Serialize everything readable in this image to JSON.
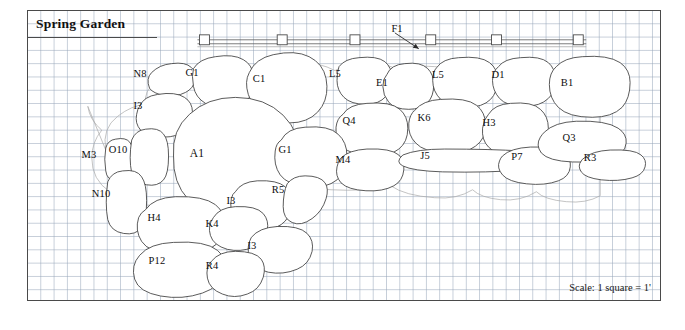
{
  "plan": {
    "title": "Spring Garden",
    "scale_note": "Scale: 1 square = 1'",
    "grid_square_px": 13.3,
    "colors": {
      "grid": "#96a5b9",
      "outline": "#3d3d3d",
      "frame": "#4a4a4a",
      "text": "#0d0d0d",
      "paper": "#ffffff"
    }
  },
  "fence": {
    "label": "F1",
    "label_x": 396,
    "label_y": 27,
    "leader_from_x": 396,
    "leader_from_y": 33,
    "leader_to_x": 422,
    "leader_to_y": 48,
    "rail_y": 42,
    "rail_x1": 196,
    "rail_x2": 585,
    "post_positions": [
      203,
      281,
      354,
      430,
      496,
      578
    ]
  },
  "beds": [
    {
      "id": "N8",
      "label": "N8",
      "x": 139,
      "y": 72,
      "size": "normal"
    },
    {
      "id": "G1a",
      "label": "G1",
      "x": 191,
      "y": 71,
      "size": "normal"
    },
    {
      "id": "C1",
      "label": "C1",
      "x": 258,
      "y": 77,
      "size": "normal"
    },
    {
      "id": "L5a",
      "label": "L5",
      "x": 334,
      "y": 72,
      "size": "normal"
    },
    {
      "id": "E1",
      "label": "E1",
      "x": 381,
      "y": 81,
      "size": "normal"
    },
    {
      "id": "L5b",
      "label": "L5",
      "x": 437,
      "y": 73,
      "size": "normal"
    },
    {
      "id": "D1",
      "label": "D1",
      "x": 497,
      "y": 73,
      "size": "normal"
    },
    {
      "id": "B1",
      "label": "B1",
      "x": 566,
      "y": 81,
      "size": "normal"
    },
    {
      "id": "I3a",
      "label": "I3",
      "x": 137,
      "y": 104,
      "size": "normal"
    },
    {
      "id": "Q4",
      "label": "Q4",
      "x": 348,
      "y": 119,
      "size": "normal"
    },
    {
      "id": "K6",
      "label": "K6",
      "x": 423,
      "y": 116,
      "size": "normal"
    },
    {
      "id": "H3",
      "label": "H3",
      "x": 488,
      "y": 121,
      "size": "normal"
    },
    {
      "id": "M3",
      "label": "M3",
      "x": 88,
      "y": 153,
      "size": "normal"
    },
    {
      "id": "O10",
      "label": "O10",
      "x": 117,
      "y": 148,
      "size": "normal"
    },
    {
      "id": "A1",
      "label": "A1",
      "x": 196,
      "y": 152,
      "size": "big"
    },
    {
      "id": "G1b",
      "label": "G1",
      "x": 284,
      "y": 148,
      "size": "normal"
    },
    {
      "id": "M4",
      "label": "M4",
      "x": 342,
      "y": 158,
      "size": "normal"
    },
    {
      "id": "J5",
      "label": "J5",
      "x": 424,
      "y": 154,
      "size": "normal"
    },
    {
      "id": "P7",
      "label": "P7",
      "x": 516,
      "y": 155,
      "size": "normal"
    },
    {
      "id": "Q3",
      "label": "Q3",
      "x": 568,
      "y": 136,
      "size": "normal"
    },
    {
      "id": "R3",
      "label": "R3",
      "x": 589,
      "y": 156,
      "size": "normal"
    },
    {
      "id": "N10",
      "label": "N10",
      "x": 100,
      "y": 192,
      "size": "normal"
    },
    {
      "id": "I3b",
      "label": "I3",
      "x": 230,
      "y": 199,
      "size": "normal"
    },
    {
      "id": "R5",
      "label": "R5",
      "x": 277,
      "y": 188,
      "size": "normal"
    },
    {
      "id": "H4",
      "label": "H4",
      "x": 153,
      "y": 216,
      "size": "normal"
    },
    {
      "id": "K4",
      "label": "K4",
      "x": 211,
      "y": 222,
      "size": "normal"
    },
    {
      "id": "I3c",
      "label": "I3",
      "x": 251,
      "y": 244,
      "size": "normal"
    },
    {
      "id": "P12",
      "label": "P12",
      "x": 156,
      "y": 259,
      "size": "normal"
    },
    {
      "id": "R4",
      "label": "R4",
      "x": 211,
      "y": 264,
      "size": "normal"
    }
  ]
}
